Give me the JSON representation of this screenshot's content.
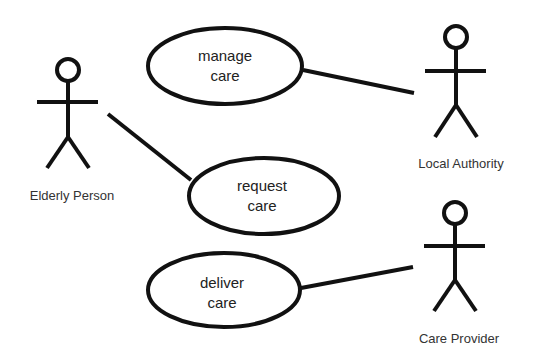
{
  "diagram": {
    "type": "uml-use-case",
    "actors": [
      {
        "id": "elderly",
        "label": "Elderly Person"
      },
      {
        "id": "authority",
        "label": "Local Authority"
      },
      {
        "id": "provider",
        "label": "Care Provider"
      }
    ],
    "use_cases": [
      {
        "id": "manage",
        "lines": [
          "manage",
          "care"
        ]
      },
      {
        "id": "request",
        "lines": [
          "request",
          "care"
        ]
      },
      {
        "id": "deliver",
        "lines": [
          "deliver",
          "care"
        ]
      }
    ],
    "associations": [
      {
        "actor": "elderly",
        "use_case": "request"
      },
      {
        "actor": "authority",
        "use_case": "manage"
      },
      {
        "actor": "provider",
        "use_case": "deliver"
      }
    ],
    "colors": {
      "line": "#111111",
      "text": "#222222",
      "background": "#ffffff"
    }
  }
}
